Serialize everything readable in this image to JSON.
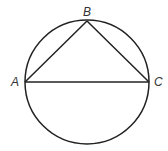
{
  "diagram": {
    "type": "geometry",
    "circle": {
      "cx": 87,
      "cy": 82,
      "r": 62
    },
    "points": {
      "A": {
        "label": "A",
        "x": 25,
        "y": 82
      },
      "B": {
        "label": "B",
        "x": 87,
        "y": 21
      },
      "C": {
        "label": "C",
        "x": 149,
        "y": 82
      }
    },
    "segments": [
      {
        "from": "A",
        "to": "B"
      },
      {
        "from": "B",
        "to": "C"
      },
      {
        "from": "A",
        "to": "C"
      }
    ],
    "colors": {
      "stroke": "#222222",
      "label": "#333333",
      "background": "#ffffff"
    }
  }
}
